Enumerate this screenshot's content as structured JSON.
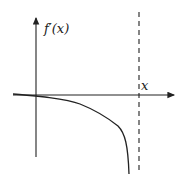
{
  "diagram": {
    "type": "function-graph",
    "y_axis_label": "f′(x)",
    "x_axis_label": "x",
    "colors": {
      "stroke": "#222222",
      "background": "#ffffff"
    },
    "asymptote": {
      "style": "dashed",
      "orientation": "vertical",
      "position": "right of origin"
    },
    "curve": "negative, decreasing, approaching vertical asymptote from left toward -infinity"
  }
}
